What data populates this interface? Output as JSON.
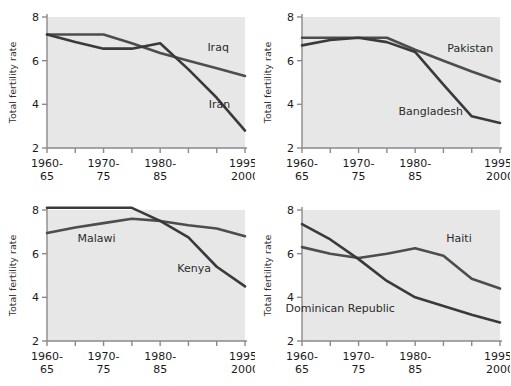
{
  "figure": {
    "type": "small-multiples-line-chart",
    "panel_count": 4,
    "background": "#ffffff",
    "plot_background": "#e7e7e7",
    "axis_color": "#8a8a8a",
    "ylabel": "Total fertility rate",
    "y_ticks": [
      "2",
      "4",
      "6",
      "8"
    ],
    "x_tick_labels": [
      {
        "line1": "1960-",
        "line2": "65"
      },
      {
        "line1": "1970-",
        "line2": "75"
      },
      {
        "line1": "1980-",
        "line2": "85"
      },
      {
        "line1": "1995-",
        "line2": "2000"
      }
    ]
  },
  "chart_data": [
    {
      "type": "line",
      "panel": "top-left",
      "title": "",
      "xlabel": "",
      "ylabel": "Total fertility rate",
      "ylim": [
        2,
        8
      ],
      "y_ticks": [
        2,
        4,
        6,
        8
      ],
      "grid": false,
      "legend": "inline-labels",
      "categories": [
        "1960-65",
        "1965-70",
        "1970-75",
        "1975-80",
        "1980-85",
        "1985-90",
        "1990-95",
        "1995-2000"
      ],
      "x_tick_labels": [
        "1960-65",
        "",
        "1970-75",
        "",
        "1980-85",
        "",
        "",
        "1995-2000"
      ],
      "series": [
        {
          "name": "Iraq",
          "color": "#4d4d4d",
          "values": [
            7.2,
            7.2,
            7.2,
            6.8,
            6.35,
            6.0,
            5.65,
            5.3
          ],
          "label_x": 6.05,
          "label_y": 6.45
        },
        {
          "name": "Iran",
          "color": "#3a3a3a",
          "values": [
            7.2,
            6.85,
            6.55,
            6.55,
            6.8,
            5.6,
            4.3,
            2.8
          ],
          "label_x": 6.1,
          "label_y": 3.85
        }
      ]
    },
    {
      "type": "line",
      "panel": "top-right",
      "title": "",
      "xlabel": "",
      "ylabel": "Total fertility rate",
      "ylim": [
        2,
        8
      ],
      "y_ticks": [
        2,
        4,
        6,
        8
      ],
      "grid": false,
      "legend": "inline-labels",
      "categories": [
        "1960-65",
        "1965-70",
        "1970-75",
        "1975-80",
        "1980-85",
        "1985-90",
        "1990-95",
        "1995-2000"
      ],
      "x_tick_labels": [
        "1960-65",
        "",
        "1970-75",
        "",
        "1980-85",
        "",
        "",
        "1995-2000"
      ],
      "series": [
        {
          "name": "Pakistan",
          "color": "#4d4d4d",
          "values": [
            7.05,
            7.05,
            7.05,
            7.05,
            6.5,
            6.0,
            5.5,
            5.05
          ],
          "label_x": 5.95,
          "label_y": 6.4
        },
        {
          "name": "Bangladesh",
          "color": "#3a3a3a",
          "values": [
            6.7,
            6.95,
            7.05,
            6.85,
            6.4,
            4.9,
            3.45,
            3.15
          ],
          "label_x": 4.55,
          "label_y": 3.5
        }
      ]
    },
    {
      "type": "line",
      "panel": "bottom-left",
      "title": "",
      "xlabel": "",
      "ylabel": "Total fertility rate",
      "ylim": [
        2,
        8
      ],
      "y_ticks": [
        2,
        4,
        6,
        8
      ],
      "grid": false,
      "legend": "inline-labels",
      "categories": [
        "1960-65",
        "1965-70",
        "1970-75",
        "1975-80",
        "1980-85",
        "1985-90",
        "1990-95",
        "1995-2000"
      ],
      "x_tick_labels": [
        "1960-65",
        "",
        "1970-75",
        "",
        "1980-85",
        "",
        "",
        "1995-2000"
      ],
      "series": [
        {
          "name": "Malawi",
          "color": "#4d4d4d",
          "values": [
            6.95,
            7.2,
            7.4,
            7.6,
            7.5,
            7.3,
            7.15,
            6.8
          ],
          "label_x": 1.75,
          "label_y": 6.55
        },
        {
          "name": "Kenya",
          "color": "#3a3a3a",
          "values": [
            8.1,
            8.1,
            8.1,
            8.1,
            7.5,
            6.75,
            5.4,
            4.5
          ],
          "label_x": 5.2,
          "label_y": 5.15
        }
      ]
    },
    {
      "type": "line",
      "panel": "bottom-right",
      "title": "",
      "xlabel": "",
      "ylabel": "Total fertility rate",
      "ylim": [
        2,
        8
      ],
      "y_ticks": [
        2,
        4,
        6,
        8
      ],
      "grid": false,
      "legend": "inline-labels",
      "categories": [
        "1960-65",
        "1965-70",
        "1970-75",
        "1975-80",
        "1980-85",
        "1985-90",
        "1990-95",
        "1995-2000"
      ],
      "x_tick_labels": [
        "1960-65",
        "",
        "1970-75",
        "",
        "1980-85",
        "",
        "",
        "1995-2000"
      ],
      "series": [
        {
          "name": "Haiti",
          "color": "#4d4d4d",
          "values": [
            6.3,
            6.0,
            5.8,
            6.0,
            6.25,
            5.9,
            4.85,
            4.4
          ],
          "label_x": 5.55,
          "label_y": 6.55
        },
        {
          "name": "Dominican Republic",
          "color": "#3a3a3a",
          "values": [
            7.35,
            6.65,
            5.75,
            4.75,
            4.0,
            3.6,
            3.2,
            2.85
          ],
          "label_x": 1.35,
          "label_y": 3.35
        }
      ]
    }
  ]
}
